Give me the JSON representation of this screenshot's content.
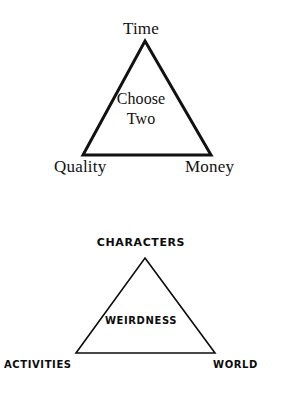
{
  "page": {
    "background_color": "#ffffff",
    "ink_color": "#000000",
    "width": 282,
    "height": 398
  },
  "diagrams": [
    {
      "id": "project-management-triangle",
      "style": "serif",
      "stroke_color": "#111111",
      "stroke_width": 3,
      "apex": {
        "x": 145,
        "y": 41
      },
      "bottom_left": {
        "x": 83,
        "y": 155
      },
      "bottom_right": {
        "x": 211,
        "y": 155
      },
      "center_label_line1": "Choose",
      "center_label_line2": "Two",
      "vertices": [
        {
          "position": "top",
          "label": "Time"
        },
        {
          "position": "bottom-left",
          "label": "Quality"
        },
        {
          "position": "bottom-right",
          "label": "Money"
        }
      ]
    },
    {
      "id": "weirdness-triangle",
      "style": "decorative-small-caps",
      "stroke_color": "#0c0c0c",
      "stroke_width": 1.6,
      "apex": {
        "x": 145,
        "y": 258
      },
      "bottom_left": {
        "x": 76,
        "y": 353
      },
      "bottom_right": {
        "x": 215,
        "y": 353
      },
      "center_label": "Weirdness",
      "vertices": [
        {
          "position": "top",
          "label": "Characters"
        },
        {
          "position": "bottom-left",
          "label": "Activities"
        },
        {
          "position": "bottom-right",
          "label": "World"
        }
      ]
    }
  ]
}
